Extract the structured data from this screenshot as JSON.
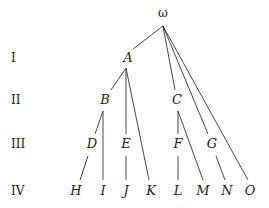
{
  "levels": [
    {
      "label": "I",
      "y": 62
    },
    {
      "label": "II",
      "y": 104
    },
    {
      "label": "III",
      "y": 148
    },
    {
      "label": "IV",
      "y": 195
    }
  ],
  "nodes": [
    {
      "id": "omega",
      "label": "ω",
      "x": 163,
      "y": 17,
      "root": true
    },
    {
      "id": "A",
      "label": "A",
      "x": 128,
      "y": 62
    },
    {
      "id": "B",
      "label": "B",
      "x": 105,
      "y": 104
    },
    {
      "id": "C",
      "label": "C",
      "x": 177,
      "y": 104
    },
    {
      "id": "D",
      "label": "D",
      "x": 92,
      "y": 148
    },
    {
      "id": "E",
      "label": "E",
      "x": 126,
      "y": 148
    },
    {
      "id": "F",
      "label": "F",
      "x": 178,
      "y": 148
    },
    {
      "id": "G",
      "label": "G",
      "x": 212,
      "y": 148
    },
    {
      "id": "H",
      "label": "H",
      "x": 76,
      "y": 195
    },
    {
      "id": "I",
      "label": "I",
      "x": 103,
      "y": 195
    },
    {
      "id": "J",
      "label": "J",
      "x": 126,
      "y": 195
    },
    {
      "id": "K",
      "label": "K",
      "x": 151,
      "y": 195
    },
    {
      "id": "L",
      "label": "L",
      "x": 178,
      "y": 195
    },
    {
      "id": "M",
      "label": "M",
      "x": 203,
      "y": 195
    },
    {
      "id": "N",
      "label": "N",
      "x": 227,
      "y": 195
    },
    {
      "id": "O",
      "label": "O",
      "x": 250,
      "y": 195
    }
  ],
  "edges": [
    {
      "from": "omega",
      "to": "A",
      "x1": 163,
      "y1": 26,
      "x2": 133,
      "y2": 49
    },
    {
      "from": "omega",
      "to": "C",
      "x1": 163,
      "y1": 26,
      "x2": 175,
      "y2": 90
    },
    {
      "from": "omega",
      "to": "G",
      "x1": 163,
      "y1": 26,
      "x2": 208,
      "y2": 134
    },
    {
      "from": "omega",
      "to": "O",
      "x1": 163,
      "y1": 26,
      "x2": 248,
      "y2": 180
    },
    {
      "from": "A",
      "to": "B",
      "x1": 126,
      "y1": 68,
      "x2": 111,
      "y2": 90
    },
    {
      "from": "A",
      "to": "E",
      "x1": 126,
      "y1": 68,
      "x2": 126,
      "y2": 134
    },
    {
      "from": "A",
      "to": "K",
      "x1": 126,
      "y1": 68,
      "x2": 149,
      "y2": 180
    },
    {
      "from": "B",
      "to": "D",
      "x1": 103,
      "y1": 111,
      "x2": 95,
      "y2": 134
    },
    {
      "from": "B",
      "to": "I",
      "x1": 103,
      "y1": 111,
      "x2": 103,
      "y2": 180
    },
    {
      "from": "D",
      "to": "H",
      "x1": 88,
      "y1": 156,
      "x2": 80,
      "y2": 180
    },
    {
      "from": "E",
      "to": "J",
      "x1": 126,
      "y1": 156,
      "x2": 126,
      "y2": 180
    },
    {
      "from": "C",
      "to": "F",
      "x1": 178,
      "y1": 111,
      "x2": 178,
      "y2": 134
    },
    {
      "from": "C",
      "to": "M",
      "x1": 178,
      "y1": 111,
      "x2": 203,
      "y2": 180
    },
    {
      "from": "F",
      "to": "L",
      "x1": 178,
      "y1": 156,
      "x2": 178,
      "y2": 180
    },
    {
      "from": "G",
      "to": "N",
      "x1": 216,
      "y1": 156,
      "x2": 225,
      "y2": 180
    }
  ]
}
